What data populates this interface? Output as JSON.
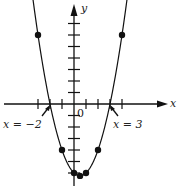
{
  "chart_data": {
    "type": "line",
    "title": "",
    "function": "y = x^2 - x - 6",
    "xlabel": "x",
    "ylabel": "y",
    "origin_label": "0",
    "x_ticks": [
      -3,
      -2,
      -1,
      1,
      2,
      3,
      4
    ],
    "y_ticks_positive": [
      1,
      2,
      3,
      4,
      5,
      6,
      7
    ],
    "y_ticks_negative": [
      -1,
      -2,
      -3,
      -4,
      -5,
      -6
    ],
    "points": [
      {
        "x": -3,
        "y": 6
      },
      {
        "x": -1,
        "y": -4
      },
      {
        "x": 0,
        "y": -6
      },
      {
        "x": 0.5,
        "y": -6.25
      },
      {
        "x": 1,
        "y": -6
      },
      {
        "x": 2,
        "y": -4
      },
      {
        "x": 4,
        "y": 6
      }
    ],
    "roots": [
      -2,
      3
    ],
    "annotations": [
      {
        "text": "x = −2",
        "points_to": {
          "x": -2,
          "y": 0
        }
      },
      {
        "text": "x = 3",
        "points_to": {
          "x": 3,
          "y": 0
        }
      }
    ],
    "grid": false
  },
  "labels": {
    "x_axis": "x",
    "y_axis": "y",
    "origin": "0",
    "root_left": "x = −2",
    "root_right": "x = 3"
  }
}
